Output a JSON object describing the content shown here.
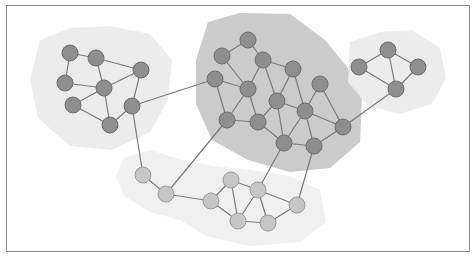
{
  "diagram": {
    "type": "network-graph",
    "colors": {
      "node_dark": "#8e8e8e",
      "node_dark_stroke": "#6e6e6e",
      "node_light": "#c6c6c6",
      "node_light_stroke": "#9a9a9a",
      "edge": "#7a7a7a",
      "region_light": "#ececec",
      "region_dark": "#cbcbcb",
      "region_bottom": "#f0f0f0"
    },
    "clusters": [
      {
        "id": "left",
        "shade": "light",
        "node_tone": "dark"
      },
      {
        "id": "middle",
        "shade": "dark",
        "node_tone": "dark"
      },
      {
        "id": "right",
        "shade": "light",
        "node_tone": "dark"
      },
      {
        "id": "bottom",
        "shade": "bottom",
        "node_tone": "light"
      }
    ],
    "nodes": [
      {
        "id": "A",
        "cluster": "left"
      },
      {
        "id": "B",
        "cluster": "left"
      },
      {
        "id": "C",
        "cluster": "left"
      },
      {
        "id": "D",
        "cluster": "left"
      },
      {
        "id": "E",
        "cluster": "left"
      },
      {
        "id": "F",
        "cluster": "left"
      },
      {
        "id": "G",
        "cluster": "left"
      },
      {
        "id": "H",
        "cluster": "left"
      },
      {
        "id": "I",
        "cluster": "middle"
      },
      {
        "id": "J",
        "cluster": "middle"
      },
      {
        "id": "K",
        "cluster": "middle"
      },
      {
        "id": "L",
        "cluster": "middle"
      },
      {
        "id": "M",
        "cluster": "middle"
      },
      {
        "id": "N",
        "cluster": "middle"
      },
      {
        "id": "O",
        "cluster": "middle"
      },
      {
        "id": "P",
        "cluster": "middle"
      },
      {
        "id": "Q",
        "cluster": "middle"
      },
      {
        "id": "R",
        "cluster": "middle"
      },
      {
        "id": "S",
        "cluster": "middle"
      },
      {
        "id": "T",
        "cluster": "middle"
      },
      {
        "id": "U",
        "cluster": "middle"
      },
      {
        "id": "V",
        "cluster": "middle"
      },
      {
        "id": "W",
        "cluster": "right"
      },
      {
        "id": "X",
        "cluster": "right"
      },
      {
        "id": "Y",
        "cluster": "right"
      },
      {
        "id": "Z",
        "cluster": "right"
      },
      {
        "id": "a",
        "cluster": "bottom"
      },
      {
        "id": "b",
        "cluster": "bottom"
      },
      {
        "id": "c",
        "cluster": "bottom"
      },
      {
        "id": "d",
        "cluster": "bottom"
      },
      {
        "id": "e",
        "cluster": "bottom"
      },
      {
        "id": "f",
        "cluster": "bottom"
      },
      {
        "id": "g",
        "cluster": "bottom"
      },
      {
        "id": "h",
        "cluster": "bottom"
      }
    ],
    "edges": [
      [
        "A",
        "B"
      ],
      [
        "A",
        "D"
      ],
      [
        "B",
        "C"
      ],
      [
        "B",
        "E"
      ],
      [
        "D",
        "E"
      ],
      [
        "C",
        "E"
      ],
      [
        "C",
        "G"
      ],
      [
        "E",
        "F"
      ],
      [
        "E",
        "H"
      ],
      [
        "F",
        "H"
      ],
      [
        "G",
        "H"
      ],
      [
        "I",
        "J"
      ],
      [
        "I",
        "K"
      ],
      [
        "J",
        "M"
      ],
      [
        "K",
        "M"
      ],
      [
        "K",
        "N"
      ],
      [
        "K",
        "O"
      ],
      [
        "N",
        "O"
      ],
      [
        "N",
        "S"
      ],
      [
        "L",
        "M"
      ],
      [
        "L",
        "Q"
      ],
      [
        "M",
        "Q"
      ],
      [
        "M",
        "R"
      ],
      [
        "O",
        "R"
      ],
      [
        "O",
        "S"
      ],
      [
        "O",
        "U"
      ],
      [
        "P",
        "S"
      ],
      [
        "P",
        "T"
      ],
      [
        "S",
        "T"
      ],
      [
        "S",
        "U"
      ],
      [
        "S",
        "V"
      ],
      [
        "Q",
        "R"
      ],
      [
        "R",
        "U"
      ],
      [
        "U",
        "V"
      ],
      [
        "V",
        "T"
      ],
      [
        "W",
        "X"
      ],
      [
        "W",
        "Y"
      ],
      [
        "W",
        "Z"
      ],
      [
        "X",
        "Z"
      ],
      [
        "Y",
        "Z"
      ],
      [
        "c",
        "d"
      ],
      [
        "c",
        "f"
      ],
      [
        "d",
        "e"
      ],
      [
        "d",
        "f"
      ],
      [
        "e",
        "f"
      ],
      [
        "e",
        "g"
      ],
      [
        "e",
        "h"
      ],
      [
        "f",
        "g"
      ],
      [
        "g",
        "h"
      ],
      [
        "G",
        "L"
      ],
      [
        "G",
        "a"
      ],
      [
        "a",
        "b"
      ],
      [
        "b",
        "Q"
      ],
      [
        "b",
        "c"
      ],
      [
        "Z",
        "T"
      ],
      [
        "e",
        "U"
      ],
      [
        "h",
        "V"
      ]
    ]
  }
}
